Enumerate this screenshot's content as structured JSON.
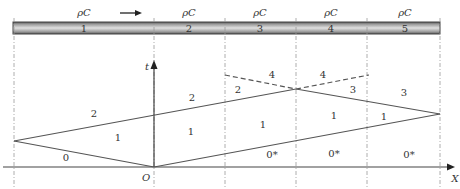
{
  "diagram": {
    "type": "x-t wave diagram (characteristics in a segmented rod)",
    "rod": {
      "segments": [
        {
          "id": "1",
          "material": "ρC"
        },
        {
          "id": "2",
          "material": "ρC"
        },
        {
          "id": "3",
          "material": "ρC"
        },
        {
          "id": "4",
          "material": "ρC"
        },
        {
          "id": "5",
          "material": "ρC"
        }
      ],
      "direction_arrow": "→"
    },
    "axes": {
      "x_label": "X",
      "t_label": "t",
      "origin_label": "O"
    },
    "region_labels": {
      "left_0": "0",
      "left_1": "1",
      "left_2": "2",
      "mid_1": "1",
      "mid_2": "2",
      "s3_2": "2",
      "s3_1": "1",
      "s3_4": "4",
      "s3_0s": "0*",
      "s4_4": "4",
      "s4_3": "3",
      "s4_1": "1",
      "s4_0s": "0*",
      "s5_3": "3",
      "s5_1": "1",
      "s5_0s": "0*"
    },
    "colors": {
      "line": "#555555",
      "rod_dark": "#555555",
      "rod_light": "#cfcfcf",
      "grid_dash": "#999999"
    }
  }
}
